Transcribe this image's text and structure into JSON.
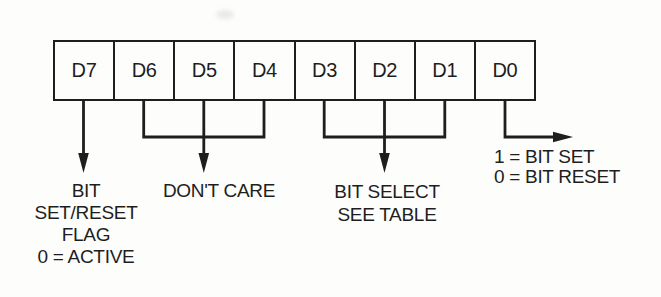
{
  "register": {
    "cells": [
      "D7",
      "D6",
      "D5",
      "D4",
      "D3",
      "D2",
      "D1",
      "D0"
    ]
  },
  "annotations": {
    "bit_set_reset_flag": {
      "lines": [
        "BIT",
        "SET/RESET",
        "FLAG",
        "0 = ACTIVE"
      ]
    },
    "dont_care": {
      "lines": [
        "DON'T CARE"
      ]
    },
    "bit_select": {
      "lines": [
        "BIT SELECT",
        "SEE TABLE"
      ]
    },
    "bit_value_legend": {
      "lines": [
        "1 = BIT SET",
        "0 = BIT RESET"
      ]
    }
  },
  "colors": {
    "ink": "#1e1e1e",
    "background": "#fdfdfc"
  }
}
